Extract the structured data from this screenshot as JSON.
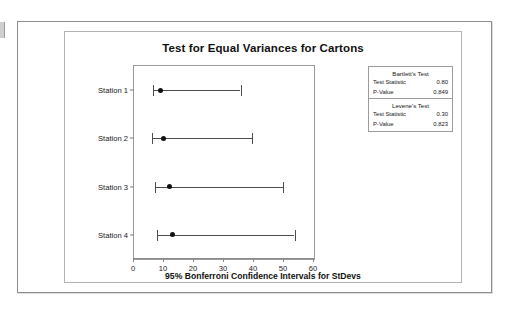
{
  "chart_data": {
    "type": "table",
    "title": "Test for Equal Variances for Cartons",
    "xlabel": "95% Bonferroni Confidence Intervals for StDevs",
    "ylabel": "",
    "xlim": [
      0,
      60
    ],
    "xticks": [
      0,
      10,
      20,
      30,
      40,
      50,
      60
    ],
    "grid": false,
    "legend_position": "right",
    "categories": [
      "Station 1",
      "Station 2",
      "Station 3",
      "Station 4"
    ],
    "intervals": [
      {
        "category": "Station 1",
        "lower": 6.4,
        "upper": 35.5,
        "center": 8.7
      },
      {
        "category": "Station 2",
        "lower": 5.9,
        "upper": 39.3,
        "center": 9.8
      },
      {
        "category": "Station 3",
        "lower": 7.1,
        "upper": 49.6,
        "center": 11.8
      },
      {
        "category": "Station 4",
        "lower": 7.6,
        "upper": 53.5,
        "center": 12.8
      }
    ],
    "tests": [
      {
        "name": "Bartlett's Test",
        "rows": [
          {
            "label": "Test Statistic",
            "value": "0.80"
          },
          {
            "label": "P-Value",
            "value": "0.849"
          }
        ]
      },
      {
        "name": "Levene's Test",
        "rows": [
          {
            "label": "Test Statistic",
            "value": "0.30"
          },
          {
            "label": "P-Value",
            "value": "0.823"
          }
        ]
      }
    ]
  },
  "colors": {
    "interval_line": "#4d4d4d",
    "point": "#111111",
    "axis": "#8a8a8a",
    "panel_border": "#b3b3b3",
    "sheet_border": "#8d8d8d",
    "background": "#ffffff"
  }
}
